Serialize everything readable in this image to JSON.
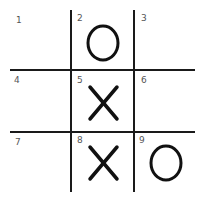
{
  "board": {
    "cells": [
      {
        "number": "1",
        "mark": ""
      },
      {
        "number": "2",
        "mark": "O"
      },
      {
        "number": "3",
        "mark": ""
      },
      {
        "number": "4",
        "mark": ""
      },
      {
        "number": "5",
        "mark": "X"
      },
      {
        "number": "6",
        "mark": ""
      },
      {
        "number": "7",
        "mark": ""
      },
      {
        "number": "8",
        "mark": "X"
      },
      {
        "number": "9",
        "mark": "O"
      }
    ]
  },
  "colors": {
    "line": "#1a1a1a",
    "mark": "#111111",
    "number": "#555555"
  }
}
